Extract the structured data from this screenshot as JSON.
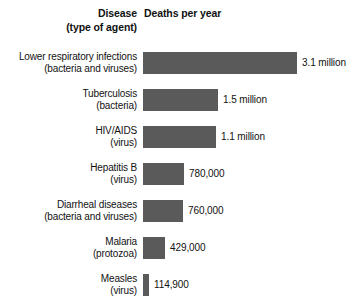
{
  "header": {
    "disease_line1": "Disease",
    "disease_line2": "(type of agent)",
    "deaths": "Deaths per year"
  },
  "chart_data": {
    "type": "bar",
    "orientation": "horizontal",
    "title": "",
    "xlabel": "Deaths per year",
    "ylabel": "Disease (type of agent)",
    "grid": false,
    "legend": null,
    "bar_color": "#5a5a5a",
    "xlim": [
      0,
      3100000
    ],
    "px_per_million": 49.7,
    "categories": [
      "Lower respiratory infections",
      "Tuberculosis",
      "HIV/AIDS",
      "Hepatitis B",
      "Diarrheal diseases",
      "Malaria",
      "Measles"
    ],
    "agents": [
      "(bacteria and viruses)",
      "(bacteria)",
      "(virus)",
      "(virus)",
      "(bacteria and viruses)",
      "(protozoa)",
      "(virus)"
    ],
    "values": [
      3100000,
      1500000,
      1100000,
      780000,
      760000,
      429000,
      114900
    ],
    "value_labels": [
      "3.1 million",
      "1.5 million",
      "1.1 million",
      "780,000",
      "760,000",
      "429,000",
      "114,900"
    ],
    "bar_px": [
      154,
      75,
      73,
      41,
      40,
      22,
      6
    ]
  },
  "rows": [
    {
      "disease": "Lower respiratory infections",
      "agent": "(bacteria and viruses)",
      "value_label": "3.1 million",
      "value": 3100000,
      "bar_px": 154
    },
    {
      "disease": "Tuberculosis",
      "agent": "(bacteria)",
      "value_label": "1.5 million",
      "value": 1500000,
      "bar_px": 75
    },
    {
      "disease": "HIV/AIDS",
      "agent": "(virus)",
      "value_label": "1.1 million",
      "value": 1100000,
      "bar_px": 73
    },
    {
      "disease": "Hepatitis B",
      "agent": "(virus)",
      "value_label": "780,000",
      "value": 780000,
      "bar_px": 41
    },
    {
      "disease": "Diarrheal diseases",
      "agent": "(bacteria and viruses)",
      "value_label": "760,000",
      "value": 760000,
      "bar_px": 40
    },
    {
      "disease": "Malaria",
      "agent": "(protozoa)",
      "value_label": "429,000",
      "value": 429000,
      "bar_px": 22
    },
    {
      "disease": "Measles",
      "agent": "(virus)",
      "value_label": "114,900",
      "value": 114900,
      "bar_px": 6
    }
  ]
}
